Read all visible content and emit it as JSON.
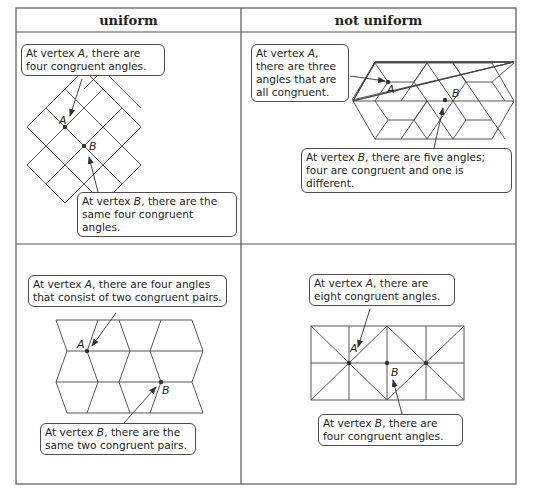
{
  "table": {
    "columns": [
      {
        "label": "uniform"
      },
      {
        "label": "not uniform"
      }
    ],
    "border_color": "#555555"
  },
  "cells": {
    "top_left": {
      "column": "uniform",
      "tiling": "square grid rotated 45°",
      "vertex_labels": [
        "A",
        "B"
      ],
      "callouts": {
        "a": {
          "prefix": "At vertex ",
          "vertex": "A",
          "suffix": ", there are four congruent angles."
        },
        "b": {
          "prefix": "At vertex ",
          "vertex": "B",
          "suffix": ", there are the same four congruent angles."
        }
      }
    },
    "top_right": {
      "column": "not uniform",
      "tiling": "rhombus / hexagon tiling",
      "vertex_labels": [
        "A",
        "B"
      ],
      "callouts": {
        "a": {
          "prefix": "At vertex ",
          "vertex": "A",
          "suffix": ", there are three angles that are all congruent."
        },
        "b": {
          "prefix": "At vertex ",
          "vertex": "B",
          "suffix": ", there are five angles; four are congruent and one is different."
        }
      }
    },
    "bottom_left": {
      "column": "uniform",
      "tiling": "zigzag parallelogram tiling",
      "vertex_labels": [
        "A",
        "B"
      ],
      "callouts": {
        "a": {
          "prefix": "At vertex ",
          "vertex": "A",
          "suffix": ", there are four angles that consist of two congruent pairs."
        },
        "b": {
          "prefix": "At vertex ",
          "vertex": "B",
          "suffix": ", there are the same two congruent pairs."
        }
      }
    },
    "bottom_right": {
      "column": "not uniform",
      "tiling": "rectangle grid with diagonals (right triangles)",
      "vertex_labels": [
        "A",
        "B"
      ],
      "callouts": {
        "a": {
          "prefix": "At vertex ",
          "vertex": "A",
          "suffix": ", there are eight congruent angles."
        },
        "b": {
          "prefix": "At vertex ",
          "vertex": "B",
          "suffix": ", there are four congruent angles."
        }
      }
    }
  }
}
